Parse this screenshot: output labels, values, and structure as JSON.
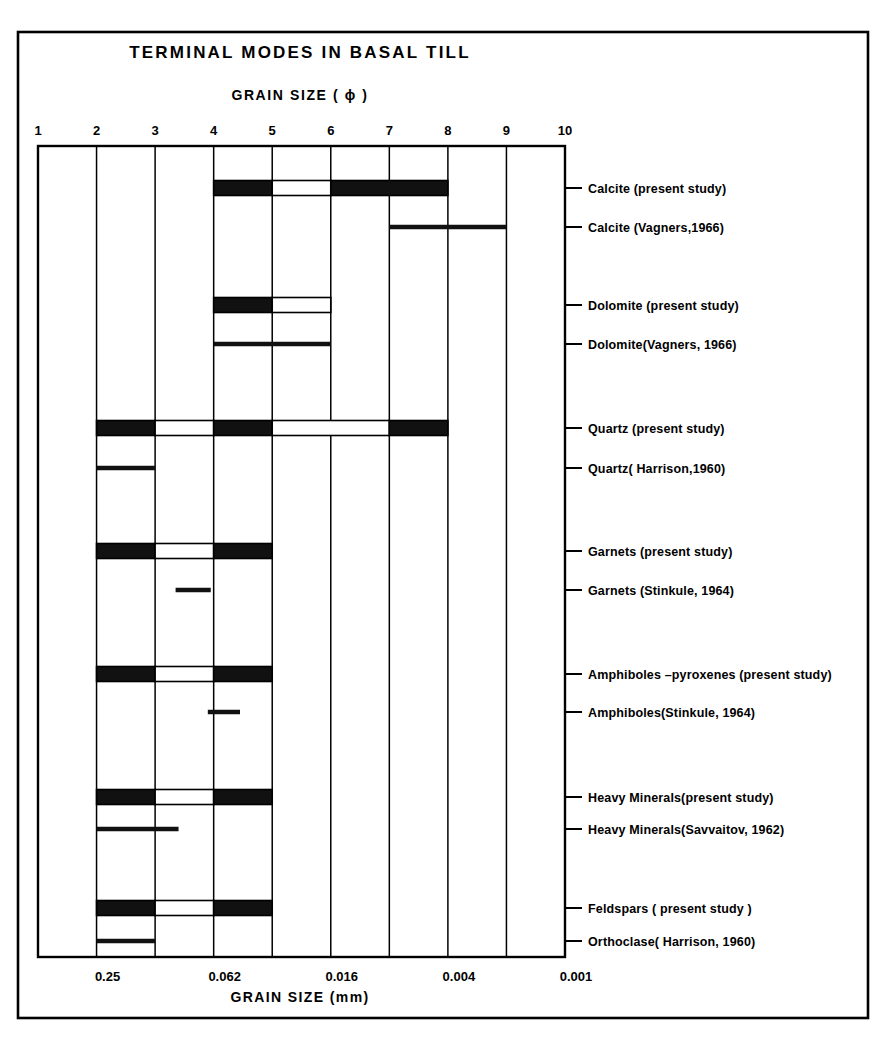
{
  "figure": {
    "title": "TERMINAL MODES IN BASAL TILL",
    "top_axis_title": "GRAIN SIZE  ( ϕ )",
    "bottom_axis_title": "GRAIN SIZE   (mm)"
  },
  "chart_data": {
    "type": "bar",
    "title": "TERMINAL MODES IN BASAL TILL",
    "xlabel": "GRAIN SIZE ( phi )",
    "xlabel_secondary": "GRAIN SIZE (mm)",
    "ylabel": "",
    "orientation": "horizontal",
    "xlim": [
      1,
      10
    ],
    "grid": true,
    "legend": "none",
    "x_axis_top": {
      "label": "GRAIN SIZE  ( ϕ )",
      "ticks": [
        1,
        2,
        3,
        4,
        5,
        6,
        7,
        8,
        9,
        10
      ],
      "tick_labels": [
        "1",
        "2",
        "3",
        "4",
        "5",
        "6",
        "7",
        "8",
        "9",
        "10"
      ]
    },
    "x_axis_bottom": {
      "label": "GRAIN SIZE   (mm)",
      "ticks": [
        2,
        4,
        6,
        8,
        10
      ],
      "tick_labels": [
        "0.25",
        "0.062",
        "0.016",
        "0.004",
        "0.001"
      ]
    },
    "series": [
      {
        "name": "Calcite (present study)",
        "style": "block",
        "segments": [
          {
            "start": 4.0,
            "end": 5.0,
            "fill": "solid"
          },
          {
            "start": 5.0,
            "end": 6.0,
            "fill": "hollow"
          },
          {
            "start": 6.0,
            "end": 8.0,
            "fill": "solid"
          }
        ]
      },
      {
        "name": "Calcite  (Vagners,1966)",
        "style": "line",
        "segments": [
          {
            "start": 7.0,
            "end": 9.0,
            "fill": "solid"
          }
        ]
      },
      {
        "name": "Dolomite (present study)",
        "style": "block",
        "segments": [
          {
            "start": 4.0,
            "end": 5.0,
            "fill": "solid"
          },
          {
            "start": 5.0,
            "end": 6.0,
            "fill": "hollow"
          }
        ]
      },
      {
        "name": "Dolomite(Vagners, 1966)",
        "style": "line",
        "segments": [
          {
            "start": 4.0,
            "end": 6.0,
            "fill": "solid"
          }
        ]
      },
      {
        "name": "Quartz (present study)",
        "style": "block",
        "segments": [
          {
            "start": 2.0,
            "end": 3.0,
            "fill": "solid"
          },
          {
            "start": 3.0,
            "end": 4.0,
            "fill": "hollow"
          },
          {
            "start": 4.0,
            "end": 5.0,
            "fill": "solid"
          },
          {
            "start": 5.0,
            "end": 7.0,
            "fill": "hollow"
          },
          {
            "start": 7.0,
            "end": 8.0,
            "fill": "solid"
          }
        ]
      },
      {
        "name": "Quartz( Harrison,1960)",
        "style": "line",
        "segments": [
          {
            "start": 2.0,
            "end": 3.0,
            "fill": "solid"
          }
        ]
      },
      {
        "name": "Garnets (present  study)",
        "style": "block",
        "segments": [
          {
            "start": 2.0,
            "end": 3.0,
            "fill": "solid"
          },
          {
            "start": 3.0,
            "end": 4.0,
            "fill": "hollow"
          },
          {
            "start": 4.0,
            "end": 5.0,
            "fill": "solid"
          }
        ]
      },
      {
        "name": "Garnets (Stinkule, 1964)",
        "style": "line",
        "segments": [
          {
            "start": 3.35,
            "end": 3.95,
            "fill": "solid"
          }
        ]
      },
      {
        "name": "Amphiboles –pyroxenes (present study)",
        "style": "block",
        "segments": [
          {
            "start": 2.0,
            "end": 3.0,
            "fill": "solid"
          },
          {
            "start": 3.0,
            "end": 4.0,
            "fill": "hollow"
          },
          {
            "start": 4.0,
            "end": 5.0,
            "fill": "solid"
          }
        ]
      },
      {
        "name": "Amphiboles(Stinkule, 1964)",
        "style": "line",
        "segments": [
          {
            "start": 3.9,
            "end": 4.45,
            "fill": "solid"
          }
        ]
      },
      {
        "name": "Heavy  Minerals(present study)",
        "style": "block",
        "segments": [
          {
            "start": 2.0,
            "end": 3.0,
            "fill": "solid"
          },
          {
            "start": 3.0,
            "end": 4.0,
            "fill": "hollow"
          },
          {
            "start": 4.0,
            "end": 5.0,
            "fill": "solid"
          }
        ]
      },
      {
        "name": "Heavy Minerals(Savvaitov, 1962)",
        "style": "line",
        "segments": [
          {
            "start": 2.0,
            "end": 3.4,
            "fill": "solid"
          }
        ]
      },
      {
        "name": "Feldspars ( present  study )",
        "style": "block",
        "segments": [
          {
            "start": 2.0,
            "end": 3.0,
            "fill": "solid"
          },
          {
            "start": 3.0,
            "end": 4.0,
            "fill": "hollow"
          },
          {
            "start": 4.0,
            "end": 5.0,
            "fill": "solid"
          }
        ]
      },
      {
        "name": "Orthoclase( Harrison, 1960)",
        "style": "line",
        "segments": [
          {
            "start": 2.0,
            "end": 3.0,
            "fill": "solid"
          }
        ]
      }
    ],
    "colors": {
      "ink": "#000000",
      "background": "#ffffff",
      "solid_fill": "#111111",
      "hollow_fill": "#ffffff"
    }
  }
}
